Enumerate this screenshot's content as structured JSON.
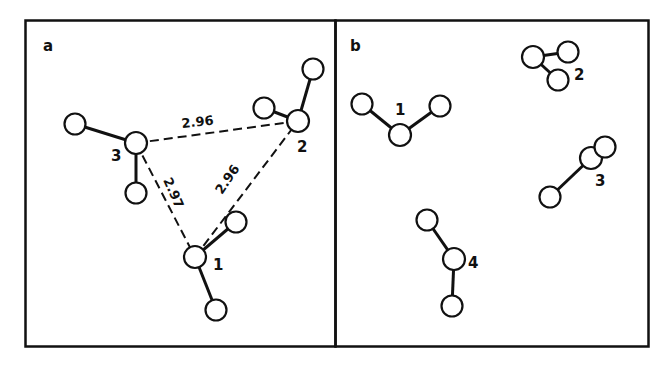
{
  "panels": [
    {
      "label": "a",
      "molecules": [
        {
          "label": "1",
          "center": [
            195,
            257
          ],
          "neighbors": [
            [
              236,
              222
            ],
            [
              216,
              310
            ]
          ],
          "label_pos": [
            213,
            270
          ]
        },
        {
          "label": "2",
          "center": [
            298,
            121
          ],
          "neighbors": [
            [
              264,
              108
            ],
            [
              313,
              69
            ]
          ],
          "label_pos": [
            297,
            152
          ]
        },
        {
          "label": "3",
          "center": [
            136,
            143
          ],
          "neighbors": [
            [
              75,
              124
            ],
            [
              136,
              193
            ]
          ],
          "label_pos": [
            111,
            161
          ]
        }
      ],
      "distances": [
        {
          "value": "2.96",
          "from": "3",
          "to": "2",
          "pos": [
            182,
            128
          ],
          "rotate": -6
        },
        {
          "value": "2.97",
          "from": "3",
          "to": "1",
          "pos": [
            163,
            180
          ],
          "rotate": 66
        },
        {
          "value": "2.96",
          "from": "1",
          "to": "2",
          "pos": [
            222,
            195
          ],
          "rotate": -56
        }
      ]
    },
    {
      "label": "b",
      "molecules": [
        {
          "label": "1",
          "center": [
            400,
            135
          ],
          "neighbors": [
            [
              362,
              104
            ],
            [
              440,
              106
            ]
          ],
          "label_pos": [
            395,
            115
          ]
        },
        {
          "label": "2",
          "center": [
            533,
            57
          ],
          "neighbors": [
            [
              568,
              52
            ],
            [
              558,
              80
            ]
          ],
          "label_pos": [
            574,
            80
          ]
        },
        {
          "label": "3",
          "center": [
            591,
            158
          ],
          "neighbors": [
            [
              605,
              147
            ],
            [
              550,
              197
            ]
          ],
          "label_pos": [
            595,
            186
          ]
        },
        {
          "label": "4",
          "center": [
            454,
            259
          ],
          "neighbors": [
            [
              427,
              220
            ],
            [
              452,
              306
            ]
          ],
          "label_pos": [
            468,
            268
          ]
        }
      ]
    }
  ]
}
